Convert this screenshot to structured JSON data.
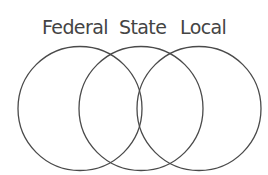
{
  "diagram": {
    "type": "venn",
    "sets": [
      {
        "label": "Federal",
        "cx": 80,
        "cy": 108.5,
        "r": 62
      },
      {
        "label": "State",
        "cx": 141,
        "cy": 108.5,
        "r": 62
      },
      {
        "label": "Local",
        "cx": 199,
        "cy": 108.5,
        "r": 62
      }
    ],
    "stroke_color": "#4a4a4a",
    "text_color": "#444444",
    "background": "#ffffff"
  }
}
